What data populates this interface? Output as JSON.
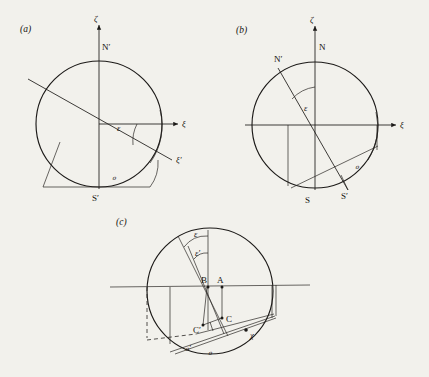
{
  "figure": {
    "background_color": "#f2f1ec",
    "ink_color": "#1c1a18",
    "panel_count": 3
  },
  "panels": [
    {
      "id": "a",
      "label": "(a)",
      "center": [
        99,
        124
      ],
      "radius": 63,
      "axes": {
        "vertical_label": "ζ",
        "horizontal_label": "ξ",
        "rotated_label": "ξ′"
      },
      "points": [
        {
          "name": "N-prime",
          "label": "N′",
          "x": 99,
          "y": 61
        },
        {
          "name": "S-prime",
          "label": "S′",
          "x": 99,
          "y": 187
        }
      ],
      "angles": [
        {
          "name": "epsilon",
          "label": "ε",
          "x": 120,
          "y": 128
        }
      ],
      "script_o": {
        "label": "ℴ",
        "x": 116,
        "y": 176
      }
    },
    {
      "id": "b",
      "label": "(b)",
      "center": [
        315,
        125
      ],
      "radius": 63,
      "axes": {
        "vertical_label": "ζ",
        "horizontal_label": "ξ"
      },
      "points": [
        {
          "name": "N",
          "label": "N",
          "x": 320,
          "y": 62
        },
        {
          "name": "N-prime",
          "label": "N′",
          "x": 281,
          "y": 70
        },
        {
          "name": "S",
          "label": "S",
          "x": 309,
          "y": 196
        },
        {
          "name": "S-prime",
          "label": "S′",
          "x": 345,
          "y": 193
        }
      ],
      "angles": [
        {
          "name": "epsilon",
          "label": "ε",
          "x": 311,
          "y": 107
        }
      ],
      "script_o": {
        "label": "ℴ",
        "x": 359,
        "y": 166
      }
    },
    {
      "id": "c",
      "label": "(c)",
      "center": [
        210,
        291
      ],
      "radius": 63,
      "points": [
        {
          "name": "A",
          "label": "A",
          "x": 224,
          "y": 283
        },
        {
          "name": "B",
          "label": "B",
          "x": 207,
          "y": 283
        },
        {
          "name": "C",
          "label": "C",
          "x": 222,
          "y": 320
        },
        {
          "name": "C-prime",
          "label": "C′",
          "x": 203,
          "y": 330
        },
        {
          "name": "chi",
          "label": "χ",
          "x": 249,
          "y": 335
        }
      ],
      "angles": [
        {
          "name": "epsilon",
          "label": "ε",
          "x": 197,
          "y": 231
        },
        {
          "name": "epsilon-prime",
          "label": "ε′",
          "x": 199,
          "y": 249
        }
      ],
      "script_o_primed": {
        "label": "ℴ′",
        "x": 190,
        "y": 348
      },
      "script_o": {
        "label": "ℴ",
        "x": 211,
        "y": 352
      }
    }
  ],
  "symbols": {
    "zeta": "ζ",
    "xi": "ξ",
    "xi_prime": "ξ′",
    "epsilon": "ε",
    "epsilon_prime": "ε′",
    "chi": "χ",
    "script_o": "ℴ",
    "script_o_prime": "ℴ′"
  }
}
